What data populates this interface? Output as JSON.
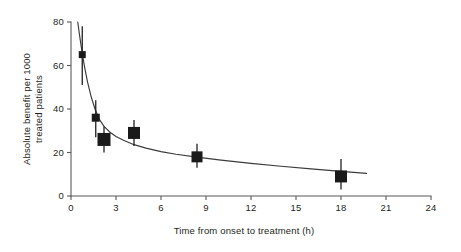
{
  "chart_data": {
    "type": "scatter",
    "title": "",
    "xlabel": "Time from onset to treatment (h)",
    "ylabel": "Absolute benefit per 1000 treated patients",
    "ylabel_lines": [
      "Absolute benefit per 1000",
      "treated patients"
    ],
    "xlim": [
      0,
      24
    ],
    "ylim": [
      0,
      80
    ],
    "xticks": [
      0,
      3,
      6,
      9,
      12,
      15,
      18,
      21,
      24
    ],
    "xtick_labels": [
      "0",
      "3",
      "6",
      "9",
      "12",
      "15",
      "18",
      "21",
      "24"
    ],
    "yticks": [
      0,
      20,
      40,
      60,
      80
    ],
    "ytick_labels": [
      "0",
      "20",
      "40",
      "60",
      "80"
    ],
    "grid": false,
    "legend": false,
    "marker_style": "filled-square",
    "points": [
      {
        "x": 0.75,
        "y": 65,
        "ylow": 51,
        "yhigh": 78,
        "size": 7
      },
      {
        "x": 1.65,
        "y": 36,
        "ylow": 27,
        "yhigh": 44,
        "size": 8
      },
      {
        "x": 2.2,
        "y": 26,
        "ylow": 20,
        "yhigh": 32,
        "size": 13
      },
      {
        "x": 4.2,
        "y": 29,
        "ylow": 23,
        "yhigh": 35,
        "size": 12
      },
      {
        "x": 8.4,
        "y": 18,
        "ylow": 13,
        "yhigh": 24,
        "size": 11
      },
      {
        "x": 18.0,
        "y": 9,
        "ylow": 3,
        "yhigh": 17,
        "size": 12
      }
    ],
    "fit_curve": {
      "description": "monotonically decreasing fitted benefit curve",
      "x": [
        0.45,
        0.6,
        0.75,
        0.9,
        1.1,
        1.35,
        1.6,
        1.9,
        2.2,
        2.6,
        3.0,
        3.5,
        4.2,
        5.0,
        6.0,
        7.0,
        8.4,
        10.0,
        12.0,
        14.0,
        16.0,
        18.0,
        19.7
      ],
      "y": [
        80.0,
        72.5,
        65.5,
        59.5,
        52.5,
        45.5,
        40.0,
        35.2,
        32.0,
        29.3,
        27.4,
        25.6,
        23.6,
        22.0,
        20.4,
        19.2,
        17.9,
        16.5,
        15.0,
        13.7,
        12.5,
        11.3,
        10.4
      ]
    },
    "colors": {
      "marker": "#1a1a1a",
      "curve": "#3b3b3d",
      "axis": "#58595b",
      "text": "#231f20",
      "background": "#ffffff"
    }
  },
  "figure": {
    "caption": ""
  }
}
